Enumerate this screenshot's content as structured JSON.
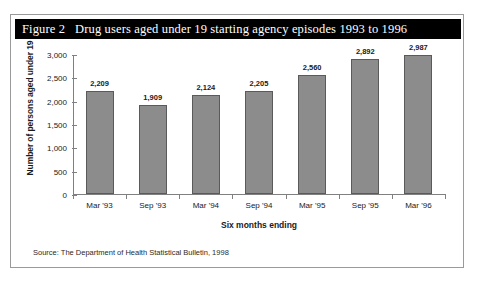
{
  "figure": {
    "title": "Figure 2   Drug users aged under 19 starting agency episodes 1993 to 1996",
    "source": "Source: The Department of Health Statistical Bulletin, 1998"
  },
  "chart_data": {
    "type": "bar",
    "title": "Figure 2   Drug users aged under 19 starting agency episodes 1993 to 1996",
    "categories": [
      "Mar '93",
      "Sep '93",
      "Mar '94",
      "Sep '94",
      "Mar '95",
      "Sep '95",
      "Mar '96"
    ],
    "values": [
      2209,
      1909,
      2124,
      2205,
      2560,
      2892,
      2987
    ],
    "value_labels": [
      "2,209",
      "1,909",
      "2,124",
      "2,205",
      "2,560",
      "2,892",
      "2,987"
    ],
    "xlabel": "Six months ending",
    "ylabel": "Number of persons aged under 19",
    "ylim": [
      0,
      3000
    ],
    "ytick_values": [
      0,
      500,
      1000,
      1500,
      2000,
      2500,
      3000
    ],
    "ytick_labels": [
      "0",
      "500",
      "1,000",
      "1,500",
      "2,000",
      "2,500",
      "3,000"
    ],
    "grid": false,
    "legend": "none",
    "bar_color": "#8c8c8c",
    "bar_border_color": "#5a5a5a",
    "axis_color": "#808080",
    "title_band_color": "#000000",
    "title_text_color": "#ffffff"
  }
}
